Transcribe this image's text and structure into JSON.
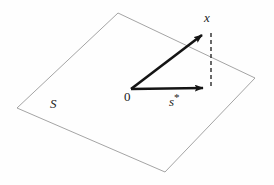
{
  "figure": {
    "background_color": "#fefefe",
    "plane": {
      "name": "subspace-plane",
      "label": "S",
      "stroke_color": "#9a9a9a",
      "stroke_width": 0.9,
      "fill": "none",
      "vertices": [
        {
          "x": 118,
          "y": 13
        },
        {
          "x": 255,
          "y": 78
        },
        {
          "x": 165,
          "y": 172
        },
        {
          "x": 17,
          "y": 108
        }
      ]
    },
    "origin": {
      "label": "0",
      "x": 131,
      "y": 89
    },
    "vectors": [
      {
        "name": "vector-x",
        "label": "x",
        "from": {
          "x": 131,
          "y": 89
        },
        "to": {
          "x": 206,
          "y": 32
        },
        "color": "#141414",
        "width": 2.6
      },
      {
        "name": "vector-s-star",
        "label": "s*",
        "label_base": "s",
        "label_superscript": "*",
        "from": {
          "x": 131,
          "y": 89
        },
        "to": {
          "x": 209,
          "y": 88
        },
        "color": "#141414",
        "width": 2.6
      }
    ],
    "projection_line": {
      "name": "projection-dashed-line",
      "from": {
        "x": 211,
        "y": 33
      },
      "to": {
        "x": 211,
        "y": 87
      },
      "color": "#2a2a2a",
      "width": 1.4,
      "dash": "4,3"
    }
  }
}
